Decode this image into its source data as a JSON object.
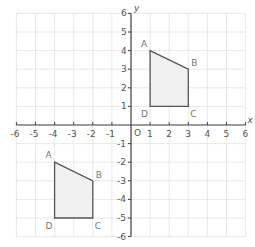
{
  "diagram": {
    "type": "coordinate-plane",
    "axes": {
      "x_label": "x",
      "y_label": "y",
      "origin_label": "O",
      "x_range": [
        -6,
        6
      ],
      "y_range": [
        -6,
        6
      ],
      "x_ticks": [
        -6,
        -5,
        -4,
        -3,
        -2,
        -1,
        1,
        2,
        3,
        4,
        5,
        6
      ],
      "y_ticks": [
        6,
        5,
        4,
        3,
        2,
        1,
        -1,
        -2,
        -3,
        -4,
        -5,
        -6
      ],
      "grid": true
    },
    "colors": {
      "grid": "#e2e2e2",
      "axis": "#444444",
      "shape_stroke": "#555555",
      "shape_fill": "#f0f0f0"
    },
    "shapes": [
      {
        "name": "quadrilateral-abcd-upper",
        "vertices": [
          {
            "label": "A",
            "x": 1,
            "y": 4
          },
          {
            "label": "B",
            "x": 3,
            "y": 3
          },
          {
            "label": "C",
            "x": 3,
            "y": 1
          },
          {
            "label": "D",
            "x": 1,
            "y": 1
          }
        ]
      },
      {
        "name": "quadrilateral-abcd-lower",
        "vertices": [
          {
            "label": "A",
            "x": -4,
            "y": -2
          },
          {
            "label": "B",
            "x": -2,
            "y": -3
          },
          {
            "label": "C",
            "x": -2,
            "y": -5
          },
          {
            "label": "D",
            "x": -4,
            "y": -5
          }
        ]
      }
    ]
  }
}
